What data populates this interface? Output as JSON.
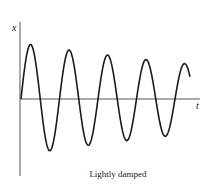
{
  "figure": {
    "y_axis_label": "x",
    "x_axis_label": "t",
    "caption": "Lightly damped",
    "line_color": "#1a1a1a"
  },
  "chart_data": {
    "type": "line",
    "title": "Lightly damped",
    "xlabel": "t",
    "ylabel": "x",
    "grid": false,
    "peaks": [
      {
        "t": 0.05,
        "x": 1.0
      },
      {
        "t": 0.27,
        "x": 0.95
      },
      {
        "t": 0.49,
        "x": 0.91
      },
      {
        "t": 0.7,
        "x": 0.87
      },
      {
        "t": 0.91,
        "x": 0.8
      }
    ],
    "troughs": [
      {
        "t": 0.16,
        "x": -0.98
      },
      {
        "t": 0.38,
        "x": -0.93
      },
      {
        "t": 0.59,
        "x": -0.89
      },
      {
        "t": 0.8,
        "x": -0.84
      }
    ]
  }
}
